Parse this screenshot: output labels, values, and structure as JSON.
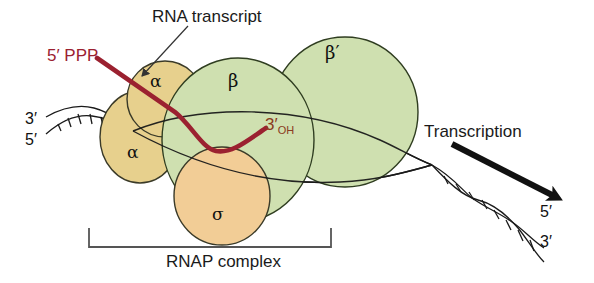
{
  "diagram": {
    "title_shown": false,
    "background": "#ffffff",
    "labels": {
      "rna_transcript": "RNA transcript",
      "five_prime_ppp": "5′ PPP",
      "three_prime_oh_main": "3",
      "three_prime_oh_sub": "OH",
      "three_prime_oh_prime": "′",
      "dna_left_top": "3′",
      "dna_left_bottom": "5′",
      "dna_right_top": "5′",
      "dna_right_bottom": "3′",
      "transcription": "Transcription",
      "rnap_complex": "RNAP complex"
    },
    "subunits": [
      {
        "name": "alpha-upper",
        "glyph": "α",
        "color": "#e7d08d"
      },
      {
        "name": "alpha-lower",
        "glyph": "α",
        "color": "#e7d08d"
      },
      {
        "name": "beta",
        "glyph": "β",
        "color": "#cfe0b0"
      },
      {
        "name": "beta-prime",
        "glyph": "β′",
        "color": "#cfe0b0"
      },
      {
        "name": "sigma",
        "glyph": "σ",
        "color": "#f2cd96"
      }
    ],
    "colors": {
      "rna_strand": "#9b2130",
      "dna_line": "#1a1a1a",
      "subunit_green": "#cfe0b0",
      "subunit_yellow": "#e7d08d",
      "subunit_orange": "#f2cd96",
      "outline": "#2b2b2b",
      "bracket": "#555555",
      "arrow_black": "#111111",
      "label_text": "#1a1a1a",
      "red_text": "#9b2130",
      "brown_text": "#8a3b21"
    }
  }
}
